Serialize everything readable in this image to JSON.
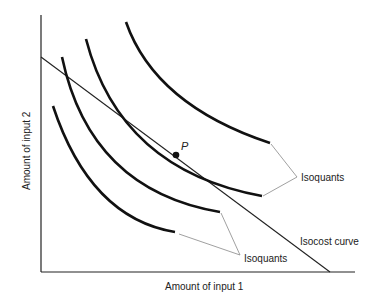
{
  "diagram": {
    "type": "isoquant-isocost",
    "axes": {
      "x_label": "Amount of input 1",
      "y_label": "Amount of input 2"
    },
    "point": {
      "label": "P",
      "description": "tangency of isocost curve and isoquant"
    },
    "labels": {
      "isoquants_upper": "Isoquants",
      "isoquants_lower": "Isoquants",
      "isocost": "Isocost curve"
    },
    "curves": [
      {
        "name": "isoquant-1",
        "order": "lowest output"
      },
      {
        "name": "isoquant-2"
      },
      {
        "name": "isoquant-3",
        "note": "tangent to isocost at P"
      },
      {
        "name": "isoquant-4",
        "order": "highest output"
      }
    ],
    "colors": {
      "ink": "#111111",
      "leader": "#888888"
    }
  }
}
